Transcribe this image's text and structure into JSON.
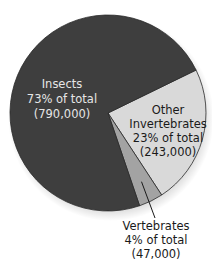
{
  "chart_data": {
    "type": "pie",
    "title": "",
    "slices": [
      {
        "name": "Insects",
        "percent": 73,
        "count": 790000,
        "percent_label": "73% of total",
        "count_label": "(790,000)",
        "color": "#3e3e3e"
      },
      {
        "name": "Other Invertebrates",
        "percent": 23,
        "count": 243000,
        "percent_label": "23% of total",
        "count_label": "(243,000)",
        "color": "#d9d9d9"
      },
      {
        "name": "Vertebrates",
        "percent": 4,
        "count": 47000,
        "percent_label": "4% of total",
        "count_label": "(47,000)",
        "color": "#a3a3a3"
      }
    ],
    "labels": {
      "insects": [
        "Insects",
        "73% of total",
        "(790,000)"
      ],
      "other_invertebrates": [
        "Other",
        "Invertebrates",
        "23% of total",
        "(243,000)"
      ],
      "vertebrates": [
        "Vertebrates",
        "4% of total",
        "(47,000)"
      ]
    },
    "legend": "none",
    "start_angle_deg": -26,
    "slice_order": [
      "Other Invertebrates",
      "Vertebrates",
      "Insects"
    ]
  }
}
